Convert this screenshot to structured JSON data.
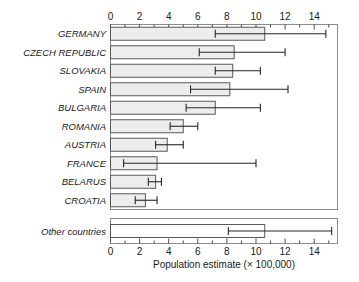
{
  "chart_data": {
    "type": "bar",
    "orientation": "horizontal",
    "title": "",
    "xlabel": "Population estimate (× 100,000)",
    "ylabel": "",
    "xlim": [
      0,
      15.6
    ],
    "xticks": [
      0,
      2,
      4,
      6,
      8,
      10,
      12,
      14
    ],
    "xticklabels": [
      "0",
      "2",
      "4",
      "6",
      "8",
      "10",
      "12",
      "14"
    ],
    "minor_ticks": [
      1,
      3,
      5,
      7,
      9,
      11,
      13,
      15
    ],
    "grid": false,
    "legend": "none",
    "categories": [
      "GERMANY",
      "CZECH REPUBLIC",
      "SLOVAKIA",
      "SPAIN",
      "BULGARIA",
      "ROMANIA",
      "AUSTRIA",
      "FRANCE",
      "BELARUS",
      "CROATIA",
      "Other countries"
    ],
    "values": [
      10.6,
      8.5,
      8.4,
      8.2,
      7.2,
      5.0,
      3.9,
      3.2,
      3.1,
      2.4,
      10.6
    ],
    "error_low": [
      7.2,
      6.1,
      7.2,
      5.5,
      5.2,
      4.1,
      3.1,
      0.9,
      2.6,
      1.7,
      8.1
    ],
    "error_high": [
      14.8,
      12.0,
      10.3,
      12.2,
      10.3,
      6.0,
      5.0,
      10.0,
      3.5,
      3.2,
      15.2
    ],
    "separated_last_category": true,
    "bar_fill": "#ededed",
    "bar_fill_last": "#ffffff",
    "bar_stroke": "#595959",
    "error_color": "#262626",
    "frame_color": "#8c8c8c",
    "background": "#ffffff"
  }
}
